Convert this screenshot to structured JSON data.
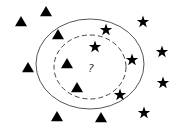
{
  "diagram": {
    "query_label": "?",
    "query_point": {
      "x": 91,
      "y": 68
    },
    "outer_circle": {
      "cx": 90,
      "cy": 64,
      "rx": 54,
      "ry": 45,
      "style": "solid",
      "color": "#555555"
    },
    "inner_circle": {
      "cx": 90,
      "cy": 67,
      "rx": 36,
      "ry": 32,
      "style": "dashed",
      "color": "#444444"
    },
    "classes": {
      "triangle": {
        "color": "#000000",
        "points": [
          {
            "x": 46,
            "y": 12
          },
          {
            "x": 21,
            "y": 22
          },
          {
            "x": 58,
            "y": 35
          },
          {
            "x": 28,
            "y": 68
          },
          {
            "x": 67,
            "y": 64
          },
          {
            "x": 77,
            "y": 88
          },
          {
            "x": 57,
            "y": 117
          },
          {
            "x": 101,
            "y": 118
          }
        ]
      },
      "star": {
        "color": "#000000",
        "points": [
          {
            "x": 143,
            "y": 22
          },
          {
            "x": 106,
            "y": 30
          },
          {
            "x": 95,
            "y": 47
          },
          {
            "x": 162,
            "y": 52
          },
          {
            "x": 132,
            "y": 60
          },
          {
            "x": 163,
            "y": 83
          },
          {
            "x": 120,
            "y": 95
          },
          {
            "x": 144,
            "y": 113
          }
        ]
      }
    }
  }
}
